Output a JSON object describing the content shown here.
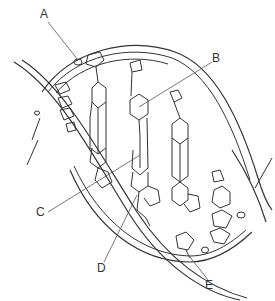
{
  "diagram": {
    "style": "black-and-white line drawing",
    "colors": {
      "stroke": "#333333",
      "background": "#ffffff"
    },
    "labels": [
      {
        "id": "A",
        "text": "A",
        "x": 40,
        "y": 8,
        "points_to": "phosphate group on backbone",
        "target": [
          78,
          60
        ]
      },
      {
        "id": "B",
        "text": "B",
        "x": 212,
        "y": 52,
        "points_to": "nitrogenous base (ring)",
        "target": [
          139,
          107
        ]
      },
      {
        "id": "C",
        "text": "C",
        "x": 36,
        "y": 206,
        "points_to": "hydrogen-bonded base pair",
        "target": [
          140,
          155
        ]
      },
      {
        "id": "D",
        "text": "D",
        "x": 97,
        "y": 262,
        "points_to": "base (ring) near backbone",
        "target": [
          137,
          195
        ]
      },
      {
        "id": "E",
        "text": "E",
        "x": 205,
        "y": 279,
        "points_to": "sugar-phosphate backbone",
        "target": [
          190,
          257
        ]
      }
    ]
  }
}
